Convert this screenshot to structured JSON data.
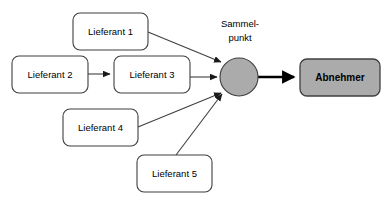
{
  "diagram": {
    "background_color": "#ffffff",
    "nodes": {
      "lieferant1": {
        "label": "Lieferant 1",
        "shape": "rounded-rect",
        "x": 73,
        "y": 13,
        "w": 75,
        "h": 37,
        "fill": "#ffffff",
        "stroke": "#3f3f3f"
      },
      "lieferant2": {
        "label": "Lieferant 2",
        "shape": "rounded-rect",
        "x": 12,
        "y": 56,
        "w": 76,
        "h": 37,
        "fill": "#ffffff",
        "stroke": "#3f3f3f"
      },
      "lieferant3": {
        "label": "Lieferant 3",
        "shape": "rounded-rect",
        "x": 114,
        "y": 56,
        "w": 76,
        "h": 37,
        "fill": "#ffffff",
        "stroke": "#3f3f3f"
      },
      "lieferant4": {
        "label": "Lieferant 4",
        "shape": "rounded-rect",
        "x": 63,
        "y": 109,
        "w": 75,
        "h": 37,
        "fill": "#ffffff",
        "stroke": "#3f3f3f"
      },
      "lieferant5": {
        "label": "Lieferant 5",
        "shape": "rounded-rect",
        "x": 137,
        "y": 155,
        "w": 75,
        "h": 37,
        "fill": "#ffffff",
        "stroke": "#3f3f3f"
      },
      "sammelpunkt": {
        "label_line1": "Sammel-",
        "label_line2": "punkt",
        "shape": "circle",
        "cx": 239,
        "cy": 77,
        "r": 19,
        "fill": "#ababab",
        "stroke": "#3f3f3f",
        "label_x": 240,
        "label_y1": 24,
        "label_y2": 38
      },
      "abnehmer": {
        "label": "Abnehmer",
        "shape": "rounded-rect",
        "x": 300,
        "y": 59,
        "w": 80,
        "h": 37,
        "fill": "#ababab",
        "stroke": "#3f3f3f"
      }
    },
    "edges": [
      {
        "name": "lieferant2-to-lieferant3",
        "from": "lieferant2",
        "to": "lieferant3",
        "x1": 88,
        "y1": 74,
        "x2": 112,
        "y2": 74,
        "weight": "thin",
        "color": "#3f3f3f"
      },
      {
        "name": "lieferant1-to-sammelpunkt",
        "from": "lieferant1",
        "to": "sammelpunkt",
        "x1": 148,
        "y1": 32,
        "x2": 223,
        "y2": 63,
        "weight": "thin",
        "color": "#3f3f3f"
      },
      {
        "name": "lieferant3-to-sammelpunkt",
        "from": "lieferant3",
        "to": "sammelpunkt",
        "x1": 190,
        "y1": 77,
        "x2": 219,
        "y2": 77,
        "weight": "thin",
        "color": "#3f3f3f"
      },
      {
        "name": "lieferant4-to-sammelpunkt",
        "from": "lieferant4",
        "to": "sammelpunkt",
        "x1": 138,
        "y1": 127,
        "x2": 223,
        "y2": 92,
        "weight": "thin",
        "color": "#3f3f3f"
      },
      {
        "name": "lieferant5-to-sammelpunkt",
        "from": "lieferant5",
        "to": "sammelpunkt",
        "x1": 176,
        "y1": 155,
        "x2": 224,
        "y2": 93,
        "weight": "thin",
        "color": "#3f3f3f"
      },
      {
        "name": "sammelpunkt-to-abnehmer",
        "from": "sammelpunkt",
        "to": "abnehmer",
        "x1": 258,
        "y1": 77,
        "x2": 297,
        "y2": 77,
        "weight": "thick",
        "color": "#000000"
      }
    ]
  }
}
